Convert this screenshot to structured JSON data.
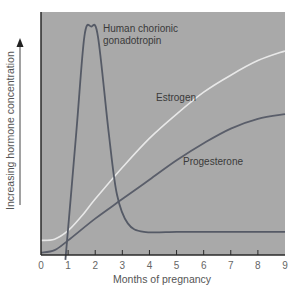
{
  "chart_data": {
    "type": "line",
    "title": "",
    "xlabel": "Months of pregnancy",
    "ylabel": "Increasing hormone concentration",
    "xlim": [
      0,
      9
    ],
    "ylim": [
      0,
      100
    ],
    "x_ticks": [
      "0",
      "1",
      "2",
      "3",
      "4",
      "5",
      "6",
      "7",
      "8",
      "9"
    ],
    "grid": false,
    "legend": "inline labels",
    "series": [
      {
        "name": "Human chorionic gonadotropin",
        "label_lines": [
          "Human chorionic",
          "gonadotropin"
        ],
        "color": "#555a66",
        "points": [
          [
            0.9,
            -2
          ],
          [
            1.3,
            50
          ],
          [
            1.6,
            90
          ],
          [
            1.85,
            94
          ],
          [
            2.1,
            90
          ],
          [
            2.5,
            50
          ],
          [
            2.8,
            25
          ],
          [
            3.2,
            13
          ],
          [
            3.8,
            9.5
          ],
          [
            5,
            9.5
          ],
          [
            6,
            9.5
          ],
          [
            7,
            9.5
          ],
          [
            8,
            9.5
          ],
          [
            9,
            9.5
          ]
        ]
      },
      {
        "name": "Estrogen",
        "color": "#e8e8e8",
        "points": [
          [
            0,
            6
          ],
          [
            0.5,
            6.5
          ],
          [
            1,
            10
          ],
          [
            1.5,
            16
          ],
          [
            2,
            23
          ],
          [
            3,
            36
          ],
          [
            4,
            48
          ],
          [
            5,
            58
          ],
          [
            6,
            67
          ],
          [
            7,
            74
          ],
          [
            8,
            80
          ],
          [
            9,
            84
          ]
        ]
      },
      {
        "name": "Progesterone",
        "color": "#5a5e6a",
        "points": [
          [
            0,
            1
          ],
          [
            0.5,
            2
          ],
          [
            1,
            6
          ],
          [
            2,
            15
          ],
          [
            3,
            23
          ],
          [
            4,
            31
          ],
          [
            5,
            39
          ],
          [
            6,
            46
          ],
          [
            7,
            52
          ],
          [
            8,
            56
          ],
          [
            9,
            58
          ]
        ]
      }
    ]
  },
  "labels": {
    "hcg_line1": "Human chorionic",
    "hcg_line2": "gonadotropin",
    "estrogen": "Estrogen",
    "progesterone": "Progesterone",
    "xlabel": "Months of pregnancy",
    "ylabel": "Increasing hormone concentration",
    "ticks": [
      "0",
      "1",
      "2",
      "3",
      "4",
      "5",
      "6",
      "7",
      "8",
      "9"
    ]
  },
  "colors": {
    "plot_bg": "#a9a9a9",
    "axis": "#2a2a2a",
    "hcg": "#555a66",
    "estrogen": "#e8e8e8",
    "progesterone": "#5a5e6a"
  }
}
